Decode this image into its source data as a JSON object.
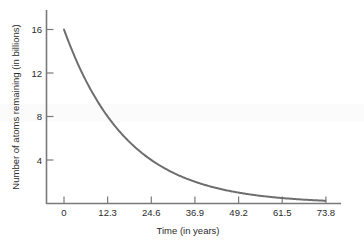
{
  "chart_data": {
    "type": "line",
    "title": "",
    "subtitle": "",
    "xlabel": "Time (in years)",
    "ylabel": "Number of atoms remaining (in billions)",
    "xlim": [
      0,
      76.0
    ],
    "ylim": [
      0,
      17.6
    ],
    "grid": false,
    "legend": null,
    "annotations": [],
    "xticks": [
      {
        "value": 0,
        "label": "0"
      },
      {
        "value": 12.3,
        "label": "12.3"
      },
      {
        "value": 24.6,
        "label": "24.6"
      },
      {
        "value": 36.9,
        "label": "36.9"
      },
      {
        "value": 49.2,
        "label": "49.2"
      },
      {
        "value": 61.5,
        "label": "61.5"
      },
      {
        "value": 73.8,
        "label": "73.8"
      }
    ],
    "yticks": [
      {
        "value": 4,
        "label": "4"
      },
      {
        "value": 8,
        "label": "8"
      },
      {
        "value": 12,
        "label": "12"
      },
      {
        "value": 16,
        "label": "16"
      }
    ],
    "series": [
      {
        "name": "atoms remaining",
        "color": "#6e6e6e",
        "model": "exponential decay",
        "initial_value": 16,
        "half_life_years": 12.3,
        "x": [
          0,
          3.075,
          6.15,
          9.225,
          12.3,
          15.375,
          18.45,
          21.525,
          24.6,
          27.675,
          30.75,
          33.825,
          36.9,
          43.05,
          49.2,
          55.35,
          61.5,
          67.65,
          73.8
        ],
        "y": [
          16.0,
          13.45,
          11.31,
          9.51,
          8.0,
          6.73,
          5.66,
          4.76,
          4.0,
          3.36,
          2.83,
          2.38,
          2.0,
          1.41,
          1.0,
          0.71,
          0.5,
          0.35,
          0.25
        ]
      }
    ]
  },
  "axis_titles": {
    "x": "Time (in years)",
    "y": "Number of atoms remaining (in billions)"
  },
  "tick_text": {
    "x": [
      "0",
      "12.3",
      "24.6",
      "36.9",
      "49.2",
      "61.5",
      "73.8"
    ],
    "y": [
      "4",
      "8",
      "12",
      "16"
    ]
  },
  "colors": {
    "curve": "#6e6e6e",
    "axis": "#7a7a7a",
    "text": "#2b2b2b",
    "background": "#ffffff",
    "rule": "#d9d9d9"
  }
}
